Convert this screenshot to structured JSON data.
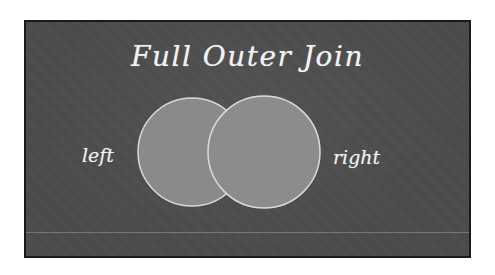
{
  "slide": {
    "title": "Full Outer Join",
    "background_color": "#4a4a4a",
    "border_color": "#1a1a1a"
  },
  "venn": {
    "left": {
      "label": "left",
      "fill": "#8a8a8a",
      "stroke": "#d8d8d8"
    },
    "right": {
      "label": "right",
      "fill": "#8c8c8c",
      "stroke": "#dadada"
    },
    "highlighted_region": "both circles (full union)"
  }
}
